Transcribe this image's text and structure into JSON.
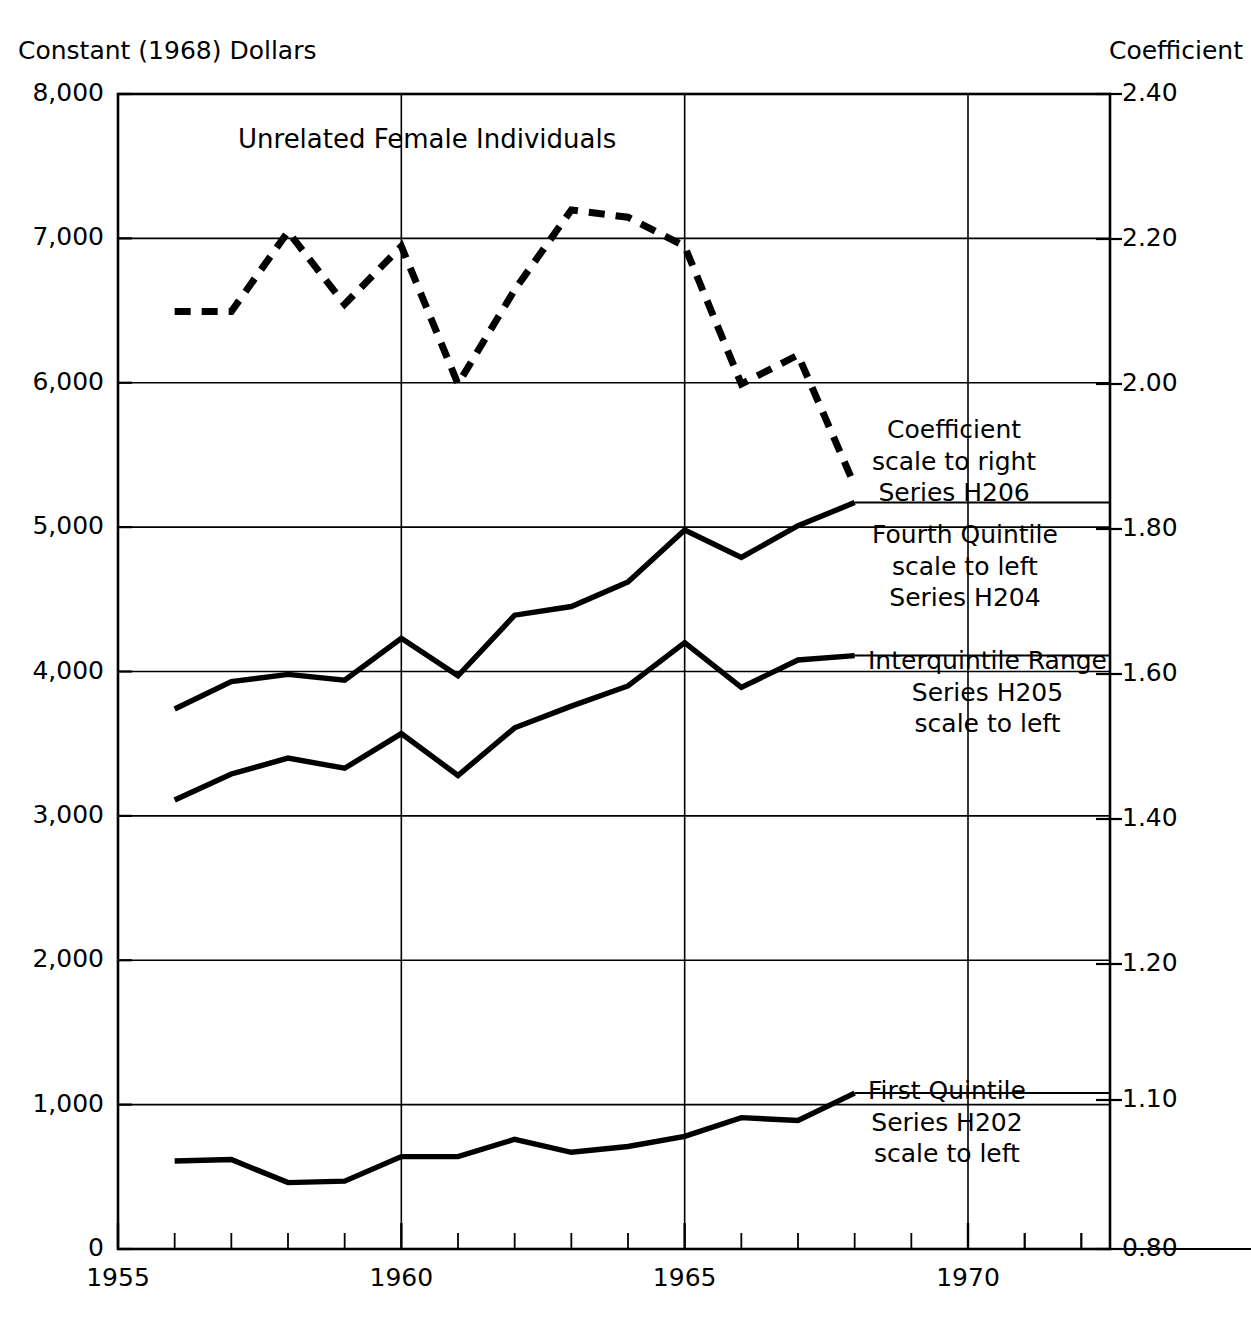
{
  "header": {
    "left_axis_title": "Constant (1968) Dollars",
    "right_axis_title": "Coefficient"
  },
  "plot_title": "Unrelated Female Individuals",
  "annotations": [
    {
      "name": "coefficient-h206",
      "lines": [
        "Coefficient",
        "scale to right",
        "Series H206"
      ]
    },
    {
      "name": "fourth-quintile-h204",
      "lines": [
        "Fourth Quintile",
        "scale to left",
        "Series H204"
      ]
    },
    {
      "name": "interquintile-range-h205",
      "lines": [
        "Interquintile Range",
        "Series H205",
        "scale to left"
      ]
    },
    {
      "name": "first-quintile-h202",
      "lines": [
        "First Quintile",
        "Series H202",
        "scale to left"
      ]
    }
  ],
  "chart_data": {
    "type": "line",
    "title": "Unrelated Female Individuals",
    "xlabel": "",
    "ylabel": "Constant (1968) Dollars",
    "y2label": "Coefficient",
    "xlim": [
      1955,
      1972
    ],
    "ylim": [
      0,
      8000
    ],
    "y2lim": [
      0.8,
      2.4
    ],
    "grid": true,
    "legend_position": "inline-right-annotations",
    "x_ticks": [
      "1955",
      "1960",
      "1965",
      "1970"
    ],
    "x_tick_values": [
      1955,
      1960,
      1965,
      1970
    ],
    "x_minor_tick_interval": 1,
    "y_ticks": [
      "0",
      "1,000",
      "2,000",
      "3,000",
      "4,000",
      "5,000",
      "6,000",
      "7,000",
      "8,000"
    ],
    "y_tick_values": [
      0,
      1000,
      2000,
      3000,
      4000,
      5000,
      6000,
      7000,
      8000
    ],
    "y2_ticks": [
      "0.80",
      "1.10",
      "1.20",
      "1.40",
      "1.60",
      "1.80",
      "2.00",
      "2.20",
      "2.40"
    ],
    "y2_tick_values": [
      0.8,
      1.1,
      1.2,
      1.4,
      1.6,
      1.8,
      2.0,
      2.2,
      2.4
    ],
    "x": [
      1956,
      1957,
      1958,
      1959,
      1960,
      1961,
      1962,
      1963,
      1964,
      1965,
      1966,
      1967,
      1968
    ],
    "series": [
      {
        "name": "Coefficient Series H206",
        "axis": "right",
        "style": "dashed",
        "values": [
          2.1,
          2.1,
          2.21,
          2.11,
          2.19,
          2.0,
          2.13,
          2.24,
          2.23,
          2.19,
          2.0,
          2.04,
          1.86
        ]
      },
      {
        "name": "Fourth Quintile Series H204",
        "axis": "left",
        "style": "solid",
        "values": [
          3740,
          3930,
          3980,
          3940,
          4230,
          3970,
          4390,
          4450,
          4620,
          4980,
          4790,
          5010,
          5170
        ]
      },
      {
        "name": "Interquintile Range Series H205",
        "axis": "left",
        "style": "solid",
        "values": [
          3110,
          3290,
          3400,
          3330,
          3570,
          3280,
          3610,
          3760,
          3900,
          4200,
          3890,
          4080,
          4110
        ]
      },
      {
        "name": "First Quintile Series H202",
        "axis": "left",
        "style": "solid",
        "values": [
          610,
          620,
          460,
          470,
          640,
          640,
          760,
          670,
          710,
          780,
          910,
          890,
          1080
        ]
      }
    ]
  }
}
